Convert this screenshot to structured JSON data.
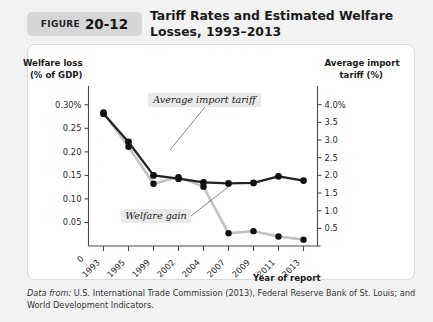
{
  "figure": {
    "badge_word": "FIGURE",
    "badge_number": "20-12",
    "title": "Tariff Rates and Estimated Welfare Losses, 1993–2013",
    "source_lead": "Data from:",
    "source_text": " U.S. International Trade Commission (2013), Federal Reserve Bank of St. Louis; and World Development Indicators."
  },
  "chart_data": {
    "type": "line",
    "title": "Tariff Rates and Estimated Welfare Losses, 1993–2013",
    "xlabel": "Year of report",
    "ylabel": "Welfare loss (% of GDP)",
    "y2label": "Average import tariff (%)",
    "grid": false,
    "legend": "annotations",
    "categories": [
      "1993",
      "1995",
      "1999",
      "2002",
      "2004",
      "2007",
      "2009",
      "2011",
      "2013"
    ],
    "x_origin_label": "0",
    "ylim": [
      0,
      0.325
    ],
    "y_ticks": [
      0.05,
      0.1,
      0.15,
      0.2,
      0.25,
      0.3
    ],
    "y_tick_labels": [
      "0.05",
      "0.10",
      "0.15",
      "0.20",
      "0.25",
      "0.30%"
    ],
    "y_axis_caption_line1": "Welfare loss",
    "y_axis_caption_line2": "(% of GDP)",
    "y2lim": [
      0,
      4.33
    ],
    "y2_ticks": [
      0.5,
      1.0,
      1.5,
      2.0,
      2.5,
      3.0,
      3.5,
      4.0
    ],
    "y2_tick_labels": [
      "0.5",
      "1.0",
      "1.5",
      "2.0",
      "2.5",
      "3.0",
      "3.5",
      "4.0%"
    ],
    "y2_axis_caption_line1": "Average import",
    "y2_axis_caption_line2": "tariff (%)",
    "series": [
      {
        "name": "Welfare loss",
        "axis": "left",
        "color": "#232323",
        "annotation": "Welfare gain",
        "values": [
          0.281,
          0.221,
          0.15,
          0.143,
          0.135,
          0.133,
          0.134,
          0.148,
          0.139
        ]
      },
      {
        "name": "Average import tariff",
        "axis": "right",
        "color": "#c2c2c2",
        "annotation": "Average import tariff",
        "values": [
          3.78,
          2.81,
          1.76,
          1.95,
          1.68,
          0.36,
          0.42,
          0.27,
          0.18
        ]
      }
    ],
    "annotations": [
      {
        "text": "Average import tariff",
        "target_category": "1999",
        "target_series": "Average import tariff"
      },
      {
        "text": "Welfare gain",
        "target_category": "2004",
        "target_series": "Average import tariff"
      }
    ]
  }
}
